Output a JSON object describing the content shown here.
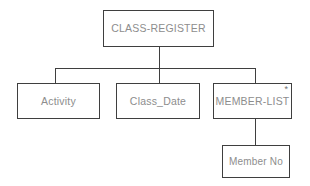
{
  "diagram": {
    "type": "hierarchical-structure-chart",
    "background_color": "#ffffff",
    "border_color": "#3f3f3f",
    "text_color": "#8d8d8d",
    "nodes": [
      {
        "id": "class-register",
        "label": "CLASS-REGISTER",
        "level": 0,
        "marker": ""
      },
      {
        "id": "activity",
        "label": "Activity",
        "level": 1,
        "marker": ""
      },
      {
        "id": "class-date",
        "label": "Class_Date",
        "level": 1,
        "marker": ""
      },
      {
        "id": "member-list",
        "label": "MEMBER-LIST",
        "level": 1,
        "marker": "*"
      },
      {
        "id": "member-no",
        "label": "Member No",
        "level": 2,
        "marker": ""
      }
    ],
    "edges": [
      {
        "from": "class-register",
        "to": "activity"
      },
      {
        "from": "class-register",
        "to": "class-date"
      },
      {
        "from": "class-register",
        "to": "member-list"
      },
      {
        "from": "member-list",
        "to": "member-no"
      }
    ]
  }
}
